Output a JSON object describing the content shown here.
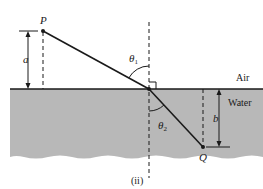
{
  "diagram": {
    "caption": "(ii)",
    "points": {
      "P": {
        "label": "P",
        "x": 43,
        "y": 31
      },
      "Q": {
        "label": "Q",
        "x": 203,
        "y": 147
      },
      "incidence": {
        "x": 149,
        "y": 89
      }
    },
    "media": {
      "upper": "Air",
      "lower": "Water"
    },
    "dimensions": {
      "a": {
        "label": "a"
      },
      "b": {
        "label": "b"
      }
    },
    "angles": {
      "theta1": {
        "symbol": "θ",
        "sub": "1"
      },
      "theta2": {
        "symbol": "θ",
        "sub": "2"
      }
    },
    "colors": {
      "water": "#b8b8b8",
      "line": "#1a1a1a",
      "background": "#ffffff"
    }
  }
}
